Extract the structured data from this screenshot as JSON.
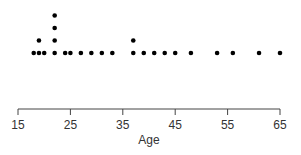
{
  "chart_data": {
    "type": "scatter",
    "subtype": "stacked-dot-plot",
    "title": "",
    "xlabel": "Age",
    "ylabel": "",
    "xlim": [
      15,
      65
    ],
    "x_ticks": [
      15,
      25,
      35,
      45,
      55,
      65
    ],
    "grid": false,
    "legend": null,
    "points": [
      {
        "x": 18,
        "count": 1
      },
      {
        "x": 19,
        "count": 2
      },
      {
        "x": 20,
        "count": 1
      },
      {
        "x": 22,
        "count": 4
      },
      {
        "x": 24,
        "count": 1
      },
      {
        "x": 25,
        "count": 1
      },
      {
        "x": 27,
        "count": 1
      },
      {
        "x": 29,
        "count": 1
      },
      {
        "x": 31,
        "count": 1
      },
      {
        "x": 33,
        "count": 1
      },
      {
        "x": 37,
        "count": 2
      },
      {
        "x": 39,
        "count": 1
      },
      {
        "x": 41,
        "count": 1
      },
      {
        "x": 43,
        "count": 1
      },
      {
        "x": 45,
        "count": 1
      },
      {
        "x": 48,
        "count": 1
      },
      {
        "x": 53,
        "count": 1
      },
      {
        "x": 56,
        "count": 1
      },
      {
        "x": 61,
        "count": 1
      },
      {
        "x": 65,
        "count": 1
      }
    ],
    "colors": {
      "dot": "#000000",
      "axis": "#444444",
      "text": "#333333"
    }
  }
}
